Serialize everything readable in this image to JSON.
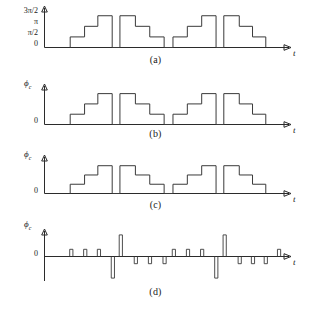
{
  "figure": {
    "panels": [
      {
        "id": "a",
        "caption": "(a)",
        "ylabel": "",
        "xlabel": "t",
        "yticks": [
          "3π/2",
          "π",
          "π/2",
          "0"
        ]
      },
      {
        "id": "b",
        "caption": "(b)",
        "ylabel": "ϕ",
        "ysub": "c",
        "xlabel": "t",
        "yticks": [
          "0"
        ]
      },
      {
        "id": "c",
        "caption": "(c)",
        "ylabel": "ϕ",
        "ysub": "c",
        "xlabel": "t",
        "yticks": [
          "0"
        ]
      },
      {
        "id": "d",
        "caption": "(d)",
        "ylabel": "ϕ",
        "ysub": "c",
        "xlabel": "t",
        "yticks": [
          "0"
        ]
      }
    ]
  },
  "chart_data": [
    {
      "type": "line",
      "panel": "a",
      "title": "",
      "xlabel": "t",
      "ylabel": "",
      "ytick_labels": [
        "0",
        "π/2",
        "π",
        "3π/2"
      ],
      "ytick_values": [
        0,
        1,
        2,
        3
      ],
      "ylim": [
        0,
        3.4
      ],
      "xlim": [
        0,
        100
      ],
      "grid": false,
      "legend": null,
      "description": "Staircase phase waveform, four bursts of ascending then descending quantized steps",
      "steps": [
        {
          "x0": 10.5,
          "x1": 17.0,
          "y": 1
        },
        {
          "x0": 17.0,
          "x1": 23.0,
          "y": 2
        },
        {
          "x0": 23.0,
          "x1": 29.5,
          "y": 3
        },
        {
          "x0": 29.5,
          "x1": 33.0,
          "y": 0
        },
        {
          "x0": 33.0,
          "x1": 40.0,
          "y": 3
        },
        {
          "x0": 40.0,
          "x1": 46.5,
          "y": 2
        },
        {
          "x0": 46.5,
          "x1": 53.0,
          "y": 1
        },
        {
          "x0": 53.0,
          "x1": 57.0,
          "y": 0
        },
        {
          "x0": 57.0,
          "x1": 63.5,
          "y": 1
        },
        {
          "x0": 63.5,
          "x1": 70.0,
          "y": 2
        },
        {
          "x0": 70.0,
          "x1": 76.5,
          "y": 3
        },
        {
          "x0": 76.5,
          "x1": 80.0,
          "y": 0
        },
        {
          "x0": 80.0,
          "x1": 87.0,
          "y": 3
        },
        {
          "x0": 87.0,
          "x1": 93.0,
          "y": 2
        },
        {
          "x0": 93.0,
          "x1": 99.0,
          "y": 1
        }
      ]
    },
    {
      "type": "line",
      "panel": "b",
      "title": "",
      "xlabel": "t",
      "ylabel": "ϕc",
      "ytick_labels": [
        "0"
      ],
      "ytick_values": [
        0
      ],
      "ylim": [
        0,
        3.4
      ],
      "xlim": [
        0,
        100
      ],
      "grid": false,
      "legend": null,
      "description": "Same quantized staircase phase waveform as panel (a), unlabeled amplitude axis",
      "steps": [
        {
          "x0": 10.5,
          "x1": 17.0,
          "y": 1
        },
        {
          "x0": 17.0,
          "x1": 23.0,
          "y": 2
        },
        {
          "x0": 23.0,
          "x1": 29.5,
          "y": 3
        },
        {
          "x0": 29.5,
          "x1": 33.0,
          "y": 0
        },
        {
          "x0": 33.0,
          "x1": 40.0,
          "y": 3
        },
        {
          "x0": 40.0,
          "x1": 46.5,
          "y": 2
        },
        {
          "x0": 46.5,
          "x1": 53.0,
          "y": 1
        },
        {
          "x0": 53.0,
          "x1": 57.0,
          "y": 0
        },
        {
          "x0": 57.0,
          "x1": 63.5,
          "y": 1
        },
        {
          "x0": 63.5,
          "x1": 70.0,
          "y": 2
        },
        {
          "x0": 70.0,
          "x1": 76.5,
          "y": 3
        },
        {
          "x0": 76.5,
          "x1": 80.0,
          "y": 0
        },
        {
          "x0": 80.0,
          "x1": 87.0,
          "y": 3
        },
        {
          "x0": 87.0,
          "x1": 93.0,
          "y": 2
        },
        {
          "x0": 93.0,
          "x1": 99.0,
          "y": 1
        }
      ]
    },
    {
      "type": "line",
      "panel": "c",
      "title": "",
      "xlabel": "t",
      "ylabel": "ϕc",
      "ytick_labels": [
        "0"
      ],
      "ytick_values": [
        0
      ],
      "ylim": [
        0,
        3.4
      ],
      "xlim": [
        0,
        100
      ],
      "grid": false,
      "legend": null,
      "description": "Quantized staircase phase waveform, compressed amplitude relative to panel (a)",
      "steps": [
        {
          "x0": 10.5,
          "x1": 17.0,
          "y": 1
        },
        {
          "x0": 17.0,
          "x1": 23.0,
          "y": 2
        },
        {
          "x0": 23.0,
          "x1": 29.5,
          "y": 3
        },
        {
          "x0": 29.5,
          "x1": 33.0,
          "y": 0
        },
        {
          "x0": 33.0,
          "x1": 40.0,
          "y": 3
        },
        {
          "x0": 40.0,
          "x1": 46.5,
          "y": 2
        },
        {
          "x0": 46.5,
          "x1": 53.0,
          "y": 1
        },
        {
          "x0": 53.0,
          "x1": 57.0,
          "y": 0
        },
        {
          "x0": 57.0,
          "x1": 63.5,
          "y": 1
        },
        {
          "x0": 63.5,
          "x1": 70.0,
          "y": 2
        },
        {
          "x0": 70.0,
          "x1": 76.5,
          "y": 3
        },
        {
          "x0": 76.5,
          "x1": 80.0,
          "y": 0
        },
        {
          "x0": 80.0,
          "x1": 87.0,
          "y": 3
        },
        {
          "x0": 87.0,
          "x1": 93.0,
          "y": 2
        },
        {
          "x0": 93.0,
          "x1": 99.0,
          "y": 1
        }
      ]
    },
    {
      "type": "bar",
      "panel": "d",
      "title": "",
      "xlabel": "t",
      "ylabel": "ϕc",
      "ytick_labels": [
        "0"
      ],
      "ytick_values": [
        0
      ],
      "ylim": [
        -3.2,
        3.2
      ],
      "xlim": [
        0,
        100
      ],
      "grid": false,
      "legend": null,
      "description": "Impulse train, the derivative of the staircase phase; narrow positive and negative pulses of unit and triple amplitude",
      "impulses": [
        {
          "x": 11.0,
          "amplitude": 1
        },
        {
          "x": 17.3,
          "amplitude": 1
        },
        {
          "x": 23.5,
          "amplitude": 1
        },
        {
          "x": 29.8,
          "amplitude": -3
        },
        {
          "x": 33.4,
          "amplitude": 3
        },
        {
          "x": 40.2,
          "amplitude": -1
        },
        {
          "x": 46.6,
          "amplitude": -1
        },
        {
          "x": 53.2,
          "amplitude": -1
        },
        {
          "x": 57.4,
          "amplitude": 1
        },
        {
          "x": 63.8,
          "amplitude": 1
        },
        {
          "x": 70.2,
          "amplitude": 1
        },
        {
          "x": 76.6,
          "amplitude": -3
        },
        {
          "x": 80.4,
          "amplitude": 3
        },
        {
          "x": 87.2,
          "amplitude": -1
        },
        {
          "x": 93.2,
          "amplitude": -1
        },
        {
          "x": 99.0,
          "amplitude": -1
        },
        {
          "x": 105.0,
          "amplitude": 1
        }
      ]
    }
  ]
}
